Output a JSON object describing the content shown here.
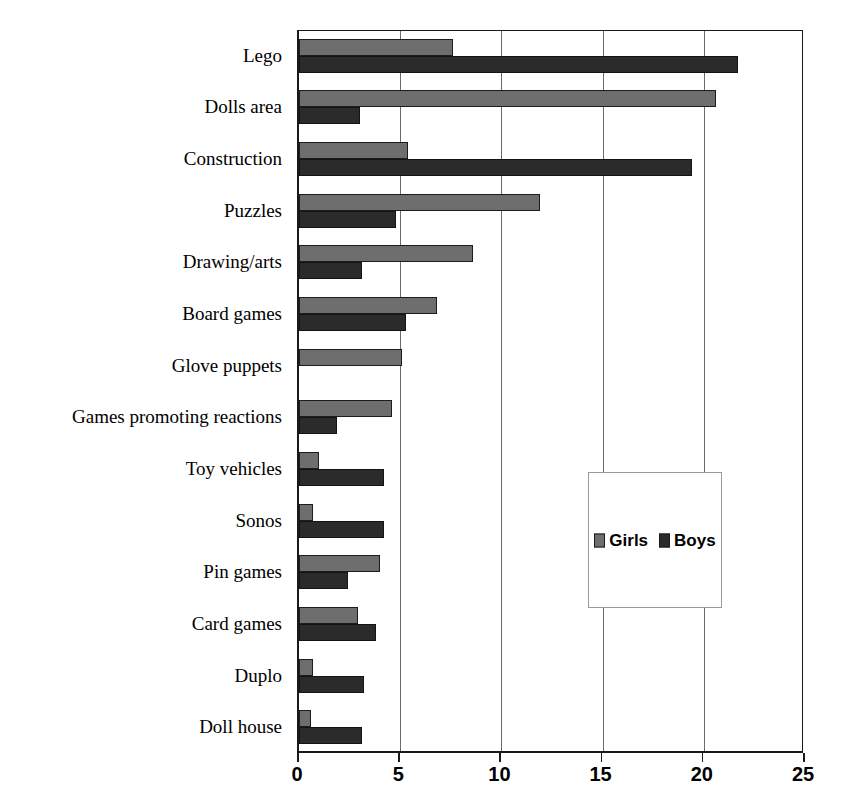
{
  "chart_data": {
    "type": "bar",
    "orientation": "horizontal",
    "title": "",
    "xlabel": "",
    "ylabel": "",
    "xlim": [
      0,
      25
    ],
    "xticks": [
      0,
      5,
      10,
      15,
      20,
      25
    ],
    "xtick_labels": [
      "0",
      "5",
      "10",
      "15",
      "20",
      "25"
    ],
    "grid": "vertical",
    "legend_position": "center-right-inside",
    "categories": [
      "Lego",
      "Dolls area",
      "Construction",
      "Puzzles",
      "Drawing/arts",
      "Board games",
      "Glove puppets",
      "Games promoting reactions",
      "Toy vehicles",
      "Sonos",
      "Pin  games",
      "Card games",
      "Duplo",
      "Doll house"
    ],
    "series": [
      {
        "name": "Girls",
        "color": "#6e6e6e",
        "values": [
          7.6,
          20.6,
          5.4,
          11.9,
          8.6,
          6.8,
          5.1,
          4.6,
          1.0,
          0.7,
          4.0,
          2.9,
          0.7,
          0.6
        ]
      },
      {
        "name": "Boys",
        "color": "#2b2b2b",
        "values": [
          21.7,
          3.0,
          19.4,
          4.8,
          3.1,
          5.3,
          0.0,
          1.9,
          4.2,
          4.2,
          2.4,
          3.8,
          3.2,
          3.1
        ]
      }
    ]
  },
  "legend": {
    "entries": [
      {
        "label": "Girls",
        "swatch": "girls-swatch"
      },
      {
        "label": "Boys",
        "swatch": "boys-swatch"
      }
    ]
  }
}
